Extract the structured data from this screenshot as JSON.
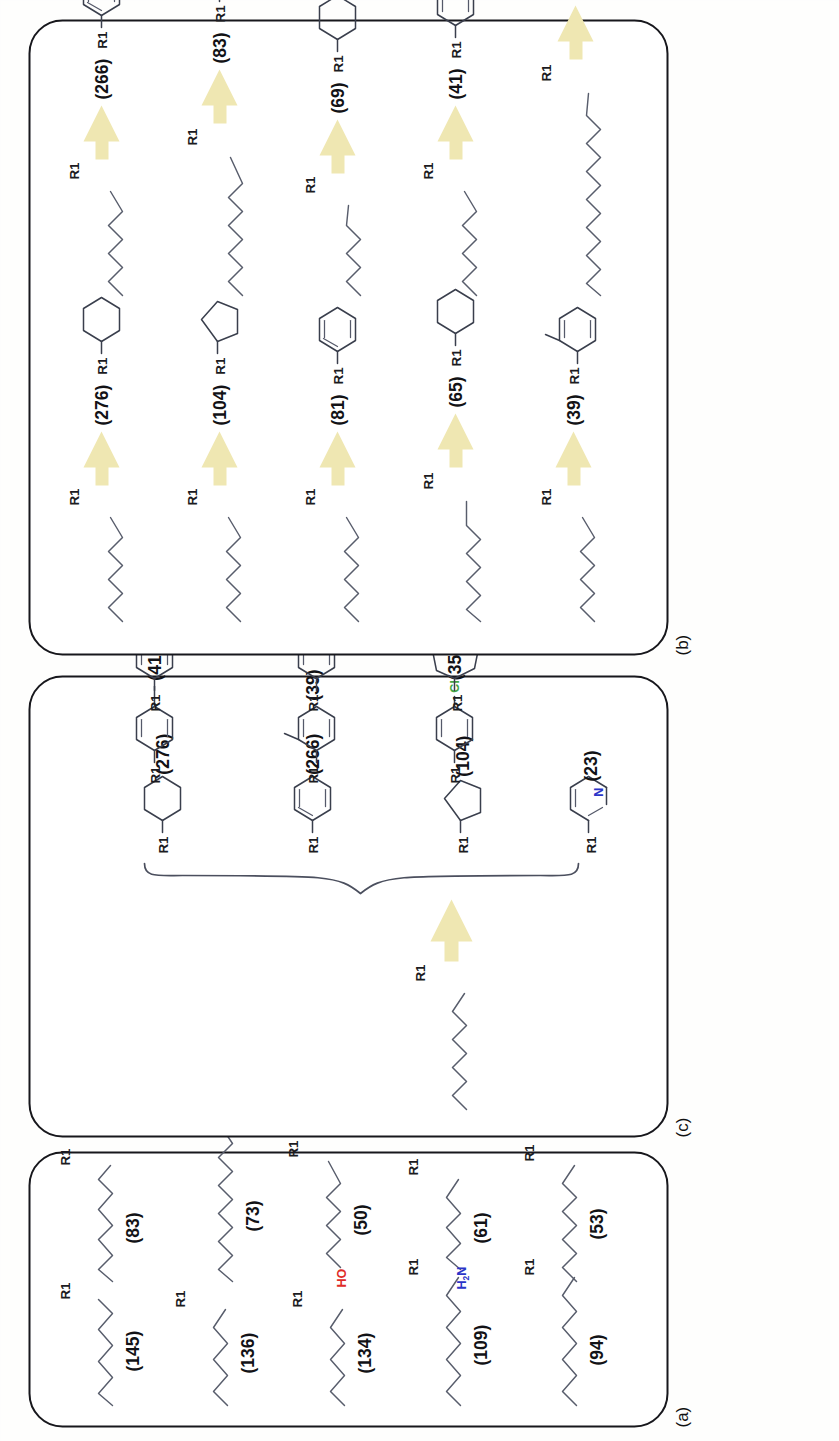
{
  "figure": {
    "panels": [
      {
        "id": "a",
        "label": "(a)"
      },
      {
        "id": "b",
        "label": "(b)"
      },
      {
        "id": "c",
        "label": "(c)"
      }
    ],
    "group_label": "R1",
    "colors": {
      "arrow": "#efe7b2",
      "bond": "#3a3f4d",
      "chain": "#585d6c",
      "panel_border": "#17171c",
      "oxygen": "#e02b28",
      "nitrogen": "#2b35c8",
      "chlorine": "#46a845",
      "fluorine": "#c9a227",
      "brace": "#4b4f5e"
    }
  },
  "panel_a": {
    "label": "(a)",
    "description": "Acyclic alkyl chain fragments with occurrence counts",
    "items": [
      {
        "count": "(145)",
        "value": 145,
        "fragment": "alkyl-chain",
        "chain_length": 7,
        "heteroatom": null
      },
      {
        "count": "(136)",
        "value": 136,
        "fragment": "alkyl-chain",
        "chain_length": 6,
        "heteroatom": null
      },
      {
        "count": "(134)",
        "value": 134,
        "fragment": "alkyl-chain",
        "chain_length": 6,
        "heteroatom": null
      },
      {
        "count": "(109)",
        "value": 109,
        "fragment": "alkyl-chain",
        "chain_length": 8,
        "heteroatom": null
      },
      {
        "count": "(94)",
        "value": 94,
        "fragment": "alkyl-chain",
        "chain_length": 8,
        "heteroatom": null
      },
      {
        "count": "(83)",
        "value": 83,
        "fragment": "alkyl-chain",
        "chain_length": 9,
        "heteroatom": null
      },
      {
        "count": "(73)",
        "value": 73,
        "fragment": "alkyl-chain",
        "chain_length": 11,
        "heteroatom": null
      },
      {
        "count": "(61)",
        "value": 61,
        "fragment": "amino-alkyl-chain",
        "chain_length": 7,
        "heteroatom": "H2N"
      },
      {
        "count": "(53)",
        "value": 53,
        "fragment": "alkyl-chain",
        "chain_length": 8,
        "heteroatom": null
      },
      {
        "count": "(50)",
        "value": 50,
        "fragment": "hydroxy-alkyl-chain",
        "chain_length": 8,
        "heteroatom": "HO"
      }
    ],
    "atom_labels": {
      "hydroxy": "HO",
      "amino": "H",
      "amino_sub": "2",
      "amino_n": "N"
    }
  },
  "panel_b": {
    "label": "(b)",
    "description": "Acyclic chain to ring transformations with occurrence counts",
    "columns": [
      {
        "entries": [
          {
            "count": "(276)",
            "value": 276,
            "from": "alkyl-chain",
            "to": "cyclohexane"
          },
          {
            "count": "(104)",
            "value": 104,
            "from": "alkyl-chain",
            "to": "cyclopentane"
          },
          {
            "count": "(81)",
            "value": 81,
            "from": "alkyl-chain",
            "to": "benzene"
          },
          {
            "count": "(65)",
            "value": 65,
            "from": "alkyl-chain",
            "to": "cyclohexane"
          },
          {
            "count": "(39)",
            "value": 39,
            "from": "alkyl-chain",
            "to": "ortho-tolyl"
          }
        ]
      },
      {
        "entries": [
          {
            "count": "(266)",
            "value": 266,
            "from": "alkyl-chain",
            "to": "benzene"
          },
          {
            "count": "(83)",
            "value": 83,
            "from": "alkyl-chain",
            "to": "benzene"
          },
          {
            "count": "(69)",
            "value": 69,
            "from": "alkyl-chain",
            "to": "cyclohexane"
          },
          {
            "count": "(41)",
            "value": 41,
            "from": "alkyl-chain",
            "to": "para-tolyl"
          },
          {
            "count": "(37)",
            "value": 37,
            "from": "alkyl-chain",
            "to": "benzyl"
          }
        ]
      }
    ]
  },
  "panel_c": {
    "label": "(c)",
    "description": "One alkyl chain maps to nine ring replacements grouped by a brace",
    "source": {
      "fragment": "alkyl-chain",
      "chain_length": 8
    },
    "products": [
      {
        "count": "(276)",
        "value": 276,
        "fragment": "cyclohexane",
        "substituent": null
      },
      {
        "count": "(266)",
        "value": 266,
        "fragment": "benzene",
        "substituent": null
      },
      {
        "count": "(104)",
        "value": 104,
        "fragment": "cyclopentane",
        "substituent": null
      },
      {
        "count": "(41)",
        "value": 41,
        "fragment": "para-tolyl",
        "substituent": "CH3"
      },
      {
        "count": "(39)",
        "value": 39,
        "fragment": "ortho-tolyl",
        "substituent": "CH3"
      },
      {
        "count": "(35)",
        "value": 35,
        "fragment": "para-chlorophenyl",
        "substituent": "Cl"
      },
      {
        "count": "(29)",
        "value": 29,
        "fragment": "para-fluorophenyl",
        "substituent": "F"
      },
      {
        "count": "(27)",
        "value": 27,
        "fragment": "meta-tolyl",
        "substituent": "CH3"
      },
      {
        "count": "(25)",
        "value": 25,
        "fragment": "cycloheptane",
        "substituent": null
      },
      {
        "count": "(23)",
        "value": 23,
        "fragment": "pyridine",
        "substituent": "N"
      }
    ],
    "atom_labels": {
      "chlorine": "Cl",
      "fluorine": "F",
      "nitrogen": "N"
    }
  }
}
